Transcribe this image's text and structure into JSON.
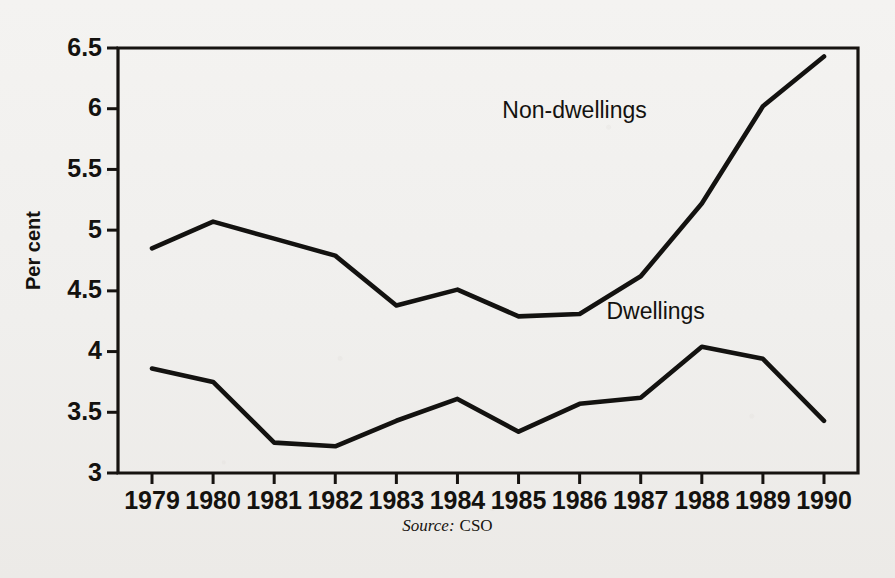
{
  "figure": {
    "background_color": "#f2f1ef",
    "ink_color": "#14120f",
    "source_prefix": "Source:",
    "source_value": "CSO"
  },
  "chart_data": {
    "type": "line",
    "title": "",
    "xlabel": "",
    "ylabel": "Per cent",
    "xlim": [
      1979,
      1990
    ],
    "ylim": [
      3,
      6.5
    ],
    "grid": false,
    "legend_position": "inline-annotation",
    "categories": [
      1979,
      1980,
      1981,
      1982,
      1983,
      1984,
      1985,
      1986,
      1987,
      1988,
      1989,
      1990
    ],
    "tick_labels_x": [
      "1979",
      "1980",
      "1981",
      "1982",
      "1983",
      "1984",
      "1985",
      "1986",
      "1987",
      "1988",
      "1989",
      "1990"
    ],
    "tick_labels_y": [
      "3",
      "3.5",
      "4",
      "4.5",
      "5",
      "5.5",
      "6",
      "6.5"
    ],
    "tick_values_y": [
      3,
      3.5,
      4,
      4.5,
      5,
      5.5,
      6,
      6.5
    ],
    "series": [
      {
        "name": "Non-dwellings",
        "label_x": 1987.1,
        "label_y": 5.92,
        "values": [
          4.85,
          5.07,
          4.93,
          4.79,
          4.38,
          4.51,
          4.29,
          4.31,
          4.62,
          5.22,
          6.02,
          6.43
        ]
      },
      {
        "name": "Dwellings",
        "label_x": 1988.05,
        "label_y": 4.27,
        "values": [
          3.86,
          3.75,
          3.25,
          3.22,
          3.43,
          3.61,
          3.34,
          3.57,
          3.62,
          4.04,
          3.94,
          3.43
        ]
      }
    ]
  }
}
